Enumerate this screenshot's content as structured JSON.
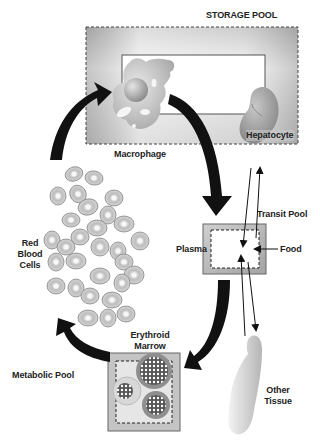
{
  "diagram": {
    "labels": {
      "storage_pool": "STORAGE POOL",
      "macrophage": "Macrophage",
      "hepatocyte": "Hepatocyte",
      "transit_pool": "Transit Pool",
      "plasma": "Plasma",
      "food": "Food",
      "red_blood_cells": [
        "Red",
        "Blood",
        "Cells"
      ],
      "erythroid_marrow": [
        "Erythroid",
        "Marrow"
      ],
      "metabolic_pool": "Metabolic Pool",
      "other_tissue": [
        "Other",
        "Tissue"
      ]
    },
    "nodes": [
      {
        "id": "storage",
        "label": "STORAGE POOL",
        "contains": [
          "Macrophage",
          "Hepatocyte"
        ]
      },
      {
        "id": "plasma",
        "label": "Plasma",
        "group": "Transit Pool"
      },
      {
        "id": "marrow",
        "label": "Erythroid Marrow",
        "group": "Metabolic Pool"
      },
      {
        "id": "rbc",
        "label": "Red Blood Cells"
      },
      {
        "id": "tissue",
        "label": "Other Tissue"
      },
      {
        "id": "food",
        "label": "Food"
      }
    ],
    "edges": [
      {
        "from": "rbc",
        "to": "macrophage",
        "style": "thick"
      },
      {
        "from": "macrophage",
        "to": "plasma",
        "style": "thick"
      },
      {
        "from": "plasma",
        "to": "marrow",
        "style": "thick"
      },
      {
        "from": "marrow",
        "to": "rbc",
        "style": "thick"
      },
      {
        "from": "plasma",
        "to": "hepatocyte",
        "style": "thin"
      },
      {
        "from": "hepatocyte",
        "to": "plasma",
        "style": "thin"
      },
      {
        "from": "plasma",
        "to": "tissue",
        "style": "thin"
      },
      {
        "from": "tissue",
        "to": "plasma",
        "style": "thin"
      },
      {
        "from": "food",
        "to": "plasma",
        "style": "thin"
      }
    ],
    "colors": {
      "arrow": "#111111",
      "box_gray": "#b9b9b9",
      "cell_gray": "#a8a8a8",
      "text": "#222222"
    }
  }
}
